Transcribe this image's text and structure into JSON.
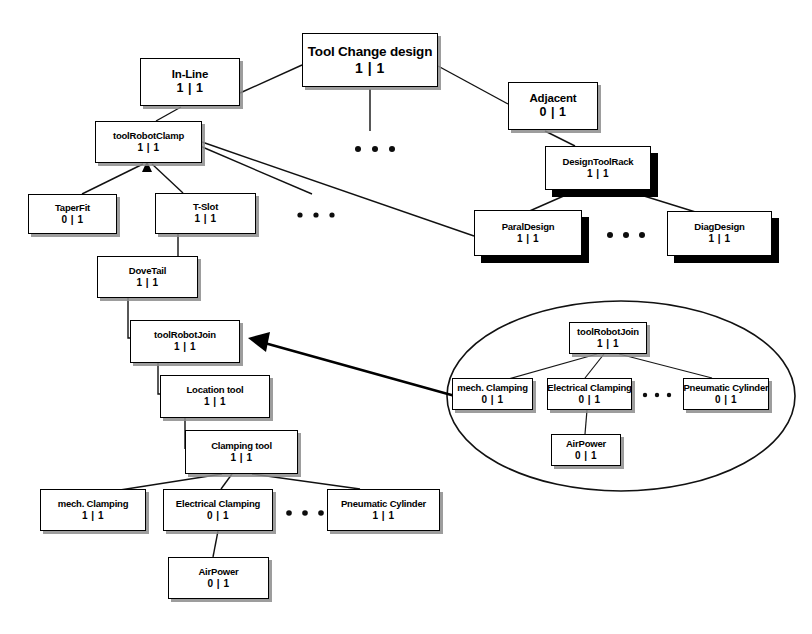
{
  "diagram": {
    "title": "Tool Change design",
    "type": "and-or-feature-tree",
    "card_separator": "|",
    "colors": {
      "line": "#111111",
      "box_border": "#000000",
      "box_fill": "#ffffff",
      "soft_shadow": "#8c8c8c",
      "hard_shadow": "#000000",
      "background": "#ffffff"
    }
  },
  "main_tree": {
    "nodes": [
      {
        "id": "root",
        "label": "Tool Change design",
        "card": "1 | 1",
        "x": 302,
        "y": 33,
        "w": 136,
        "h": 54,
        "size": "size-main",
        "shadow": "shadow-soft"
      },
      {
        "id": "inline",
        "label": "In-Line",
        "card": "1 | 1",
        "x": 140,
        "y": 58,
        "w": 100,
        "h": 48,
        "size": "size-reg",
        "shadow": "shadow-soft"
      },
      {
        "id": "adjacent",
        "label": "Adjacent",
        "card": "0 | 1",
        "x": 508,
        "y": 82,
        "w": 90,
        "h": 48,
        "size": "size-reg",
        "shadow": "shadow-soft"
      },
      {
        "id": "toolRobotClamp",
        "label": "toolRobotClamp",
        "card": "1 | 1",
        "x": 95,
        "y": 121,
        "w": 107,
        "h": 42,
        "size": "size-sm",
        "shadow": "shadow-soft"
      },
      {
        "id": "designToolRack",
        "label": "DesignToolRack",
        "card": "1 | 1",
        "x": 545,
        "y": 146,
        "w": 106,
        "h": 44,
        "size": "size-sm",
        "shadow": "shadow-hard"
      },
      {
        "id": "taperFit",
        "label": "TaperFit",
        "card": "0 | 1",
        "x": 28,
        "y": 194,
        "w": 89,
        "h": 40,
        "size": "size-sm",
        "shadow": "shadow-soft"
      },
      {
        "id": "tslot",
        "label": "T-Slot",
        "card": "1 | 1",
        "x": 155,
        "y": 193,
        "w": 101,
        "h": 41,
        "size": "size-sm",
        "shadow": "shadow-soft"
      },
      {
        "id": "paralDesign",
        "label": "ParalDesign",
        "card": "1 | 1",
        "x": 474,
        "y": 210,
        "w": 108,
        "h": 46,
        "size": "size-sm",
        "shadow": "shadow-hard"
      },
      {
        "id": "diagDesign",
        "label": "DiagDesign",
        "card": "1 | 1",
        "x": 667,
        "y": 211,
        "w": 105,
        "h": 45,
        "size": "size-sm",
        "shadow": "shadow-hard"
      },
      {
        "id": "doveTail",
        "label": "DoveTail",
        "card": "1 | 1",
        "x": 97,
        "y": 256,
        "w": 101,
        "h": 42,
        "size": "size-sm",
        "shadow": "shadow-soft"
      },
      {
        "id": "toolRobotJoin",
        "label": "toolRobotJoin",
        "card": "1 | 1",
        "x": 130,
        "y": 320,
        "w": 110,
        "h": 43,
        "size": "size-sm",
        "shadow": "shadow-soft"
      },
      {
        "id": "locationTool",
        "label": "Location tool",
        "card": "1 | 1",
        "x": 160,
        "y": 375,
        "w": 110,
        "h": 43,
        "size": "size-sm",
        "shadow": "shadow-soft"
      },
      {
        "id": "clampingTool",
        "label": "Clamping tool",
        "card": "1 | 1",
        "x": 185,
        "y": 430,
        "w": 113,
        "h": 44,
        "size": "size-sm",
        "shadow": "shadow-soft"
      },
      {
        "id": "mechClamping",
        "label": "mech. Clamping",
        "card": "1 | 1",
        "x": 40,
        "y": 489,
        "w": 106,
        "h": 42,
        "size": "size-sm",
        "shadow": "shadow-soft"
      },
      {
        "id": "electricalClamping",
        "label": "Electrical Clamping",
        "card": "0 | 1",
        "x": 163,
        "y": 489,
        "w": 110,
        "h": 42,
        "size": "size-sm",
        "shadow": "shadow-soft"
      },
      {
        "id": "pneumaticCylinder",
        "label": "Pneumatic Cylinder",
        "card": "1 | 1",
        "x": 327,
        "y": 489,
        "w": 113,
        "h": 42,
        "size": "size-sm",
        "shadow": "shadow-soft"
      },
      {
        "id": "airPower",
        "label": "AirPower",
        "card": "0 | 1",
        "x": 168,
        "y": 557,
        "w": 101,
        "h": 42,
        "size": "size-sm",
        "shadow": "shadow-soft"
      }
    ],
    "ellipsis_groups": [
      {
        "id": "dots-root",
        "x": 358,
        "y": 149,
        "count": 3,
        "gap": 17,
        "r": 3.0
      },
      {
        "id": "dots-clamp",
        "x": 300,
        "y": 215,
        "count": 3,
        "gap": 16,
        "r": 2.6
      },
      {
        "id": "dots-rack",
        "x": 610,
        "y": 235,
        "count": 3,
        "gap": 16,
        "r": 3.0
      },
      {
        "id": "dots-clamping",
        "x": 289,
        "y": 513,
        "count": 3,
        "gap": 16,
        "r": 2.8
      }
    ]
  },
  "inset": {
    "shape": "ellipse",
    "cx": 621,
    "cy": 396,
    "rx": 174,
    "ry": 95,
    "nodes": [
      {
        "id": "i-toolRobotJoin",
        "label": "toolRobotJoin",
        "card": "1 | 1",
        "x": 569,
        "y": 322,
        "w": 78,
        "h": 32,
        "size": "size-sm",
        "shadow": "shadow-soft"
      },
      {
        "id": "i-mechClamping",
        "label": "mech. Clamping",
        "card": "0 | 1",
        "x": 452,
        "y": 378,
        "w": 81,
        "h": 32,
        "size": "size-sm",
        "shadow": "shadow-soft"
      },
      {
        "id": "i-electricalClamping",
        "label": "Electrical Clamping",
        "card": "0 | 1",
        "x": 547,
        "y": 378,
        "w": 85,
        "h": 32,
        "size": "size-sm",
        "shadow": "shadow-soft"
      },
      {
        "id": "i-pneumaticCylinder",
        "label": "Pneumatic Cylinder",
        "card": "0 | 1",
        "x": 683,
        "y": 378,
        "w": 86,
        "h": 32,
        "size": "size-sm",
        "shadow": "shadow-soft"
      },
      {
        "id": "i-airPower",
        "label": "AirPower",
        "card": "0 | 1",
        "x": 551,
        "y": 434,
        "w": 70,
        "h": 32,
        "size": "size-sm",
        "shadow": "shadow-soft"
      }
    ],
    "ellipsis_groups": [
      {
        "id": "i-dots",
        "x": 645,
        "y": 395,
        "count": 3,
        "gap": 12,
        "r": 2.2
      }
    ]
  }
}
